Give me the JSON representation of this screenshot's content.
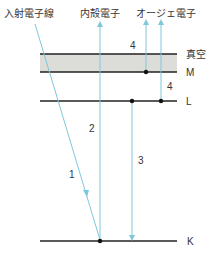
{
  "title_labels": {
    "incident": "入射電子線",
    "inner_shell": "内殻電子",
    "auger": "オージェ電子"
  },
  "levels": [
    {
      "name": "vacuum",
      "label": "真空",
      "y": 54
    },
    {
      "name": "M",
      "label": "M",
      "y": 72
    },
    {
      "name": "L",
      "label": "L",
      "y": 101
    },
    {
      "name": "K",
      "label": "K",
      "y": 241
    }
  ],
  "step_labels": {
    "step1": "1",
    "step2": "2",
    "step3": "3",
    "step4a": "4",
    "step4b": "4"
  },
  "colors": {
    "level_line": "#222222",
    "vacuum_band": "#dcdcd8",
    "arrow": "#7fc8dc",
    "text": "#333333"
  }
}
